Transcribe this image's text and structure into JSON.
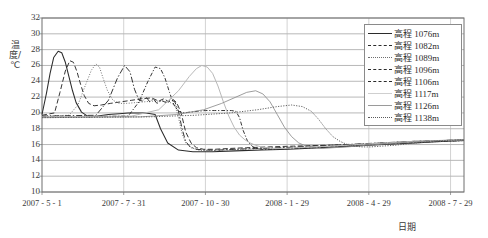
{
  "chart_data": {
    "type": "line",
    "title": "",
    "xlabel": "日期",
    "ylabel": "温度/℃",
    "ylim": [
      10,
      32
    ],
    "yticks": [
      10,
      12,
      14,
      16,
      18,
      20,
      22,
      24,
      26,
      28,
      30,
      32
    ],
    "xticks": [
      "2007 - 5 - 1",
      "2007 - 7 - 31",
      "2007 - 10 - 30",
      "2008 - 1 - 29",
      "2008 - 4 - 29",
      "2008 - 7 - 29"
    ],
    "xtick_days": [
      0,
      91,
      182,
      273,
      364,
      455
    ],
    "xlim_days": [
      0,
      470
    ],
    "grid": "both",
    "legend_position": "top-right",
    "series": [
      {
        "name": "高程 1076m",
        "label_prefix": "高程",
        "label_value": "1076m",
        "style": "solid",
        "color": "#2b2b2b",
        "x": [
          0,
          5,
          9,
          13,
          18,
          22,
          26,
          30,
          34,
          38,
          44,
          52,
          62,
          74,
          86,
          96,
          104,
          110,
          116,
          121,
          126,
          132,
          140,
          152,
          168,
          190,
          215,
          245,
          275,
          310,
          345,
          380,
          415,
          445,
          470
        ],
        "y": [
          19.8,
          22.5,
          25.0,
          27.0,
          27.8,
          27.6,
          26.4,
          24.6,
          22.8,
          21.3,
          20.1,
          19.5,
          19.6,
          19.8,
          19.9,
          20.0,
          20.0,
          20.0,
          20.0,
          19.9,
          19.8,
          18.0,
          16.2,
          15.3,
          15.1,
          15.1,
          15.2,
          15.3,
          15.4,
          15.6,
          15.8,
          16.0,
          16.2,
          16.4,
          16.5
        ]
      },
      {
        "name": "高程 1082m",
        "label_prefix": "高程",
        "label_value": "1082m",
        "style": "dashed",
        "color": "#2b2b2b",
        "x": [
          0,
          14,
          20,
          26,
          31,
          35,
          39,
          43,
          47,
          52,
          58,
          66,
          76,
          88,
          100,
          112,
          122,
          130,
          136,
          141,
          146,
          150,
          155,
          160,
          166,
          172,
          180,
          192,
          208,
          228,
          252,
          280,
          312,
          345,
          380,
          415,
          445,
          470
        ],
        "y": [
          19.7,
          20.0,
          22.6,
          25.3,
          26.6,
          26.4,
          25.2,
          23.6,
          22.2,
          21.2,
          20.9,
          21.0,
          21.2,
          21.4,
          21.6,
          21.8,
          21.9,
          21.5,
          21.8,
          21.4,
          21.7,
          21.3,
          20.0,
          17.6,
          16.2,
          15.6,
          15.4,
          15.4,
          15.5,
          15.6,
          15.7,
          15.8,
          15.9,
          16.0,
          16.2,
          16.4,
          16.5,
          16.6
        ]
      },
      {
        "name": "高程 1089m",
        "label_prefix": "高程",
        "label_value": "1089m",
        "style": "dotted",
        "color": "#6e6e6e",
        "x": [
          0,
          30,
          40,
          48,
          55,
          60,
          64,
          68,
          73,
          79,
          86,
          94,
          104,
          114,
          124,
          132,
          138,
          143,
          148,
          152,
          156,
          160,
          166,
          174,
          186,
          202,
          222,
          248,
          278,
          312,
          348,
          385,
          420,
          450,
          470
        ],
        "y": [
          19.6,
          19.7,
          21.0,
          23.4,
          25.4,
          26.2,
          25.8,
          24.4,
          22.8,
          21.6,
          21.2,
          21.2,
          21.3,
          21.4,
          21.5,
          21.5,
          21.4,
          21.3,
          21.0,
          19.4,
          17.4,
          16.2,
          15.6,
          15.3,
          15.2,
          15.3,
          15.4,
          15.5,
          15.6,
          15.7,
          15.9,
          16.1,
          16.3,
          16.4,
          16.5
        ]
      },
      {
        "name": "高程 1096m",
        "label_prefix": "高程",
        "label_value": "1096m",
        "style": "dashdot",
        "color": "#2b2b2b",
        "x": [
          0,
          60,
          74,
          84,
          92,
          98,
          103,
          108,
          112,
          116,
          120,
          124,
          128,
          133,
          138,
          143,
          148,
          152,
          156,
          160,
          165,
          172,
          182,
          196,
          214,
          238,
          266,
          300,
          338,
          376,
          412,
          444,
          470
        ],
        "y": [
          19.6,
          19.7,
          21.6,
          24.4,
          26.0,
          25.2,
          23.0,
          21.6,
          21.5,
          22.0,
          21.4,
          21.8,
          21.2,
          21.6,
          21.3,
          21.7,
          21.4,
          20.2,
          18.0,
          16.4,
          15.7,
          15.4,
          15.3,
          15.3,
          15.4,
          15.5,
          15.6,
          15.8,
          16.0,
          16.2,
          16.4,
          16.5,
          16.6
        ]
      },
      {
        "name": "高程 1106m",
        "label_prefix": "高程",
        "label_value": "1106m",
        "style": "dashdot2",
        "color": "#2b2b2b",
        "x": [
          0,
          96,
          108,
          118,
          126,
          132,
          137,
          142,
          147,
          152,
          158,
          165,
          173,
          182,
          192,
          200,
          206,
          211,
          216,
          220,
          224,
          229,
          235,
          244,
          258,
          278,
          304,
          336,
          372,
          408,
          440,
          470
        ],
        "y": [
          19.5,
          19.6,
          21.4,
          24.0,
          25.8,
          25.6,
          24.4,
          22.6,
          21.0,
          20.2,
          20.0,
          20.1,
          20.2,
          20.3,
          20.3,
          20.3,
          20.3,
          20.3,
          20.2,
          19.4,
          17.8,
          16.4,
          15.7,
          15.4,
          15.4,
          15.5,
          15.6,
          15.8,
          16.0,
          16.2,
          16.4,
          16.5
        ]
      },
      {
        "name": "高程 1117m",
        "label_prefix": "高程",
        "label_value": "1117m",
        "style": "solid-light",
        "color": "#b9b9b9",
        "x": [
          0,
          100,
          130,
          152,
          164,
          172,
          178,
          184,
          190,
          196,
          202,
          208,
          214,
          220,
          226,
          232,
          238,
          244,
          250,
          258,
          268,
          282,
          300,
          322,
          350,
          382,
          414,
          444,
          470
        ],
        "y": [
          19.5,
          19.6,
          20.4,
          22.8,
          24.6,
          25.6,
          26.0,
          25.8,
          25.0,
          23.4,
          21.4,
          19.6,
          18.2,
          17.2,
          16.6,
          16.2,
          15.9,
          15.7,
          15.6,
          15.5,
          15.5,
          15.6,
          15.7,
          15.8,
          16.0,
          16.2,
          16.4,
          16.5,
          16.6
        ]
      },
      {
        "name": "高程 1126m",
        "label_prefix": "高程",
        "label_value": "1126m",
        "style": "solid-thin",
        "color": "#8c8c8c",
        "x": [
          0,
          110,
          150,
          180,
          200,
          216,
          228,
          238,
          246,
          254,
          262,
          270,
          278,
          286,
          294,
          302,
          312,
          324,
          340,
          360,
          384,
          410,
          438,
          470
        ],
        "y": [
          19.4,
          19.5,
          19.8,
          20.4,
          21.2,
          22.0,
          22.6,
          22.8,
          22.4,
          21.4,
          19.8,
          18.2,
          17.0,
          16.2,
          15.8,
          15.6,
          15.5,
          15.6,
          15.7,
          15.9,
          16.1,
          16.3,
          16.5,
          16.6
        ]
      },
      {
        "name": "高程 1138m",
        "label_prefix": "高程",
        "label_value": "1138m",
        "style": "dotted2",
        "color": "#5a5a5a",
        "x": [
          0,
          120,
          170,
          210,
          240,
          262,
          278,
          290,
          300,
          308,
          316,
          324,
          332,
          340,
          348,
          356,
          366,
          378,
          392,
          408,
          426,
          446,
          470
        ],
        "y": [
          19.4,
          19.5,
          19.7,
          20.0,
          20.4,
          20.8,
          21.0,
          20.8,
          20.2,
          19.2,
          18.0,
          17.0,
          16.4,
          16.0,
          15.8,
          15.7,
          15.7,
          15.8,
          15.9,
          16.1,
          16.3,
          16.5,
          16.6
        ]
      }
    ]
  },
  "axes": {
    "ylabel": "温度/℃",
    "xlabel": "日期"
  }
}
